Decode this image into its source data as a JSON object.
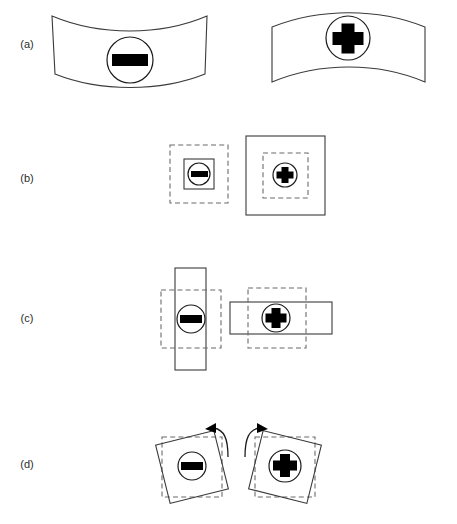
{
  "figure": {
    "background_color": "#ffffff",
    "stroke_color": "#3a3a3a",
    "dashed_stroke_color": "#6b6b6b",
    "glyph_color": "#000000",
    "label_color": "#2b2b2b",
    "width": 457,
    "height": 524
  },
  "rows": [
    {
      "id": "a",
      "label": "(a)",
      "label_x": 27,
      "label_y": 48,
      "description": "bending deformation",
      "panels": [
        {
          "id": "a-left",
          "sign": "minus",
          "marker": {
            "cx": 130,
            "cy": 60,
            "r": 23
          },
          "shape": "band-concave-up",
          "path": "M 52 16 L 55 74 C 100 92 160 92 205 74 L 207 16 C 160 36 100 36 52 16 Z"
        },
        {
          "id": "a-right",
          "sign": "plus",
          "marker": {
            "cx": 348,
            "cy": 38,
            "r": 22
          },
          "shape": "band-convex-up",
          "path": "M 272 27 L 272 82 C 320 62 378 62 425 82 L 425 27 C 378 8 320 8 272 27 Z"
        }
      ]
    },
    {
      "id": "b",
      "label": "(b)",
      "label_x": 27,
      "label_y": 182,
      "description": "isotropic dilation: contraction and expansion",
      "panels": [
        {
          "id": "b-left",
          "sign": "minus",
          "marker": {
            "cx": 199,
            "cy": 174,
            "r": 13
          },
          "reference_square": {
            "x": 170,
            "y": 145,
            "w": 58,
            "h": 58,
            "style": "dashed"
          },
          "deformed_square": {
            "x": 184,
            "y": 159,
            "w": 30,
            "h": 30,
            "style": "solid"
          }
        },
        {
          "id": "b-right",
          "sign": "plus",
          "marker": {
            "cx": 285,
            "cy": 175,
            "r": 13
          },
          "reference_square": {
            "x": 263,
            "y": 153,
            "w": 45,
            "h": 45,
            "style": "dashed"
          },
          "deformed_square": {
            "x": 246,
            "y": 136,
            "w": 79,
            "h": 79,
            "style": "solid"
          }
        }
      ]
    },
    {
      "id": "c",
      "label": "(c)",
      "label_x": 27,
      "label_y": 322,
      "description": "uniaxial stretch: vertical and horizontal",
      "panels": [
        {
          "id": "c-left",
          "sign": "minus",
          "marker": {
            "cx": 191,
            "cy": 319,
            "r": 14
          },
          "reference_square": {
            "x": 161,
            "y": 290,
            "w": 60,
            "h": 58,
            "style": "dashed"
          },
          "deformed_rect": {
            "x": 175,
            "y": 268,
            "w": 31,
            "h": 102,
            "style": "solid"
          }
        },
        {
          "id": "c-right",
          "sign": "plus",
          "marker": {
            "cx": 276,
            "cy": 318,
            "r": 14
          },
          "reference_square": {
            "x": 248,
            "y": 288,
            "w": 58,
            "h": 60,
            "style": "dashed"
          },
          "deformed_rect": {
            "x": 230,
            "y": 302,
            "w": 102,
            "h": 32,
            "style": "solid"
          }
        }
      ]
    },
    {
      "id": "d",
      "label": "(d)",
      "label_x": 27,
      "label_y": 468,
      "description": "rigid rotation",
      "panels": [
        {
          "id": "d-left",
          "sign": "minus",
          "marker": {
            "cx": 192,
            "cy": 466,
            "r": 14
          },
          "reference_square": {
            "x": 162,
            "y": 437,
            "w": 60,
            "h": 60,
            "style": "dashed"
          },
          "rotated_square": {
            "cx": 192,
            "cy": 467,
            "size": 60,
            "angle_deg": -14
          },
          "arrow": {
            "direction": "clockwise",
            "x": 216,
            "y": 428
          }
        },
        {
          "id": "d-right",
          "sign": "plus",
          "marker": {
            "cx": 285,
            "cy": 466,
            "r": 16
          },
          "reference_square": {
            "x": 255,
            "y": 437,
            "w": 60,
            "h": 60,
            "style": "dashed"
          },
          "rotated_square": {
            "cx": 285,
            "cy": 467,
            "size": 60,
            "angle_deg": 14
          },
          "arrow": {
            "direction": "counterclockwise",
            "x": 250,
            "y": 428
          }
        }
      ]
    }
  ],
  "glyphs": {
    "minus": {
      "name": "minus-sign",
      "bar_width_ratio": 0.78,
      "bar_height_ratio": 0.3
    },
    "plus": {
      "name": "plus-sign",
      "arm_width_ratio": 0.34,
      "arm_length_ratio": 0.92
    }
  }
}
